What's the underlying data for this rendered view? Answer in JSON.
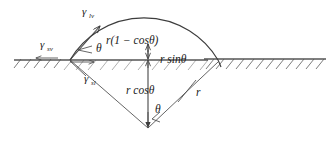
{
  "figure": {
    "background_color": "#ffffff",
    "line_color": "#3d3d3d",
    "surface_color": "#555555",
    "hatch_color": "#5a5a5a"
  },
  "labels": {
    "gamma_lv": {
      "symbol": "γ",
      "subscript": "lv",
      "description": "liquid-vapor surface tension vector"
    },
    "gamma_sv": {
      "symbol": "γ",
      "subscript": "sv",
      "description": "solid-vapor surface tension vector"
    },
    "gamma_sl": {
      "symbol": "γ",
      "subscript": "sl",
      "description": "solid-liquid surface tension vector"
    },
    "theta_contact": "θ",
    "theta_center": "θ",
    "height_expr": "r(1 − cosθ)",
    "halfwidth_expr": "r sinθ",
    "depth_expr": "r cosθ",
    "radius_expr": "r"
  },
  "geometry": {
    "surface_line_y": 60,
    "contact_point_left": [
      70,
      60
    ],
    "contact_point_right": [
      218,
      60
    ],
    "circle_center": [
      148,
      128
    ],
    "radius": 86,
    "apex": [
      148,
      42
    ],
    "contact_angle_deg": 35
  }
}
